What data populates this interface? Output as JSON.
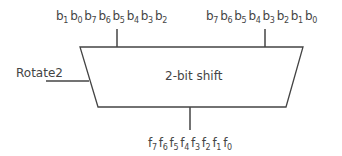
{
  "diagram": {
    "block_label": "2-bit shift",
    "control_label": "Rotate2",
    "input_left": {
      "letter": "b",
      "indices": [
        "1",
        "0",
        "7",
        "6",
        "5",
        "4",
        "3",
        "2"
      ]
    },
    "input_right": {
      "letter": "b",
      "indices": [
        "7",
        "6",
        "5",
        "4",
        "3",
        "2",
        "1",
        "0"
      ]
    },
    "output": {
      "letter": "f",
      "indices": [
        "7",
        "6",
        "5",
        "4",
        "3",
        "2",
        "1",
        "0"
      ]
    },
    "colors": {
      "stroke": "#444444",
      "text": "#444444",
      "background": "#ffffff"
    }
  }
}
